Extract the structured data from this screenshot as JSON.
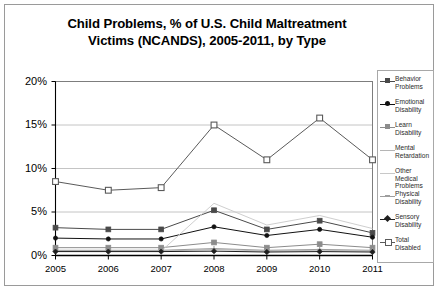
{
  "chart_data": {
    "type": "line",
    "title": "Child Problems, % of U.S. Child Maltreatment Victims (NCANDS), 2005-2011, by Type",
    "title_line1": "Child Problems, % of U.S. Child Maltreatment",
    "title_line2": "Victims (NCANDS), 2005-2011, by Type",
    "xlabel": "",
    "ylabel": "",
    "categories": [
      "2005",
      "2006",
      "2007",
      "2008",
      "2009",
      "2010",
      "2011"
    ],
    "x": [
      2005,
      2006,
      2007,
      2008,
      2009,
      2010,
      2011
    ],
    "ylim": [
      0,
      20
    ],
    "yticks": [
      0,
      5,
      10,
      15,
      20
    ],
    "ytick_labels": [
      "0%",
      "5%",
      "10%",
      "15%",
      "20%"
    ],
    "grid": true,
    "legend_position": "right",
    "series": [
      {
        "name": "Behavior Problems",
        "marker": "square-filled",
        "color": "#4a4a4a",
        "values": [
          3.2,
          3.0,
          3.0,
          5.2,
          3.0,
          4.0,
          2.6
        ]
      },
      {
        "name": "Emotional Disability",
        "marker": "circle-filled",
        "color": "#111111",
        "values": [
          2.0,
          1.9,
          1.9,
          3.3,
          2.3,
          3.0,
          2.1
        ]
      },
      {
        "name": "Learn Disability",
        "marker": "square-grey",
        "color": "#8c8c8c",
        "values": [
          0.9,
          0.9,
          0.9,
          1.5,
          0.9,
          1.3,
          0.9
        ]
      },
      {
        "name": "Mental Retardation",
        "marker": "none",
        "color": "#b5b5b5",
        "values": [
          0.5,
          0.5,
          0.5,
          0.7,
          0.5,
          0.6,
          0.5
        ]
      },
      {
        "name": "Other Medical Problems",
        "marker": "none",
        "color": "#c8c8c8",
        "values": [
          0.5,
          0.5,
          0.5,
          6.0,
          3.5,
          4.6,
          3.1
        ]
      },
      {
        "name": "Physical Disability",
        "marker": "plus",
        "color": "#9e9e9e",
        "values": [
          0.6,
          0.6,
          0.6,
          0.8,
          0.6,
          0.7,
          0.6
        ]
      },
      {
        "name": "Sensory Disability",
        "marker": "diamond-filled",
        "color": "#1f1f1f",
        "values": [
          0.45,
          0.45,
          0.45,
          0.5,
          0.4,
          0.45,
          0.4
        ]
      },
      {
        "name": "Total Disabled",
        "marker": "square-open",
        "color": "#5a5a5a",
        "values": [
          8.5,
          7.5,
          7.8,
          15.0,
          11.0,
          15.8,
          11.0
        ]
      }
    ]
  }
}
